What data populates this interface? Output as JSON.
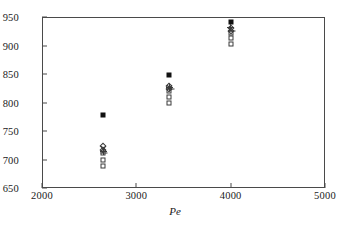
{
  "chart_data": {
    "type": "scatter",
    "title": "",
    "xlabel": "Pe",
    "ylabel": "",
    "xlim": [
      2000,
      5000
    ],
    "ylim": [
      650,
      950
    ],
    "xticks": [
      2000,
      3000,
      4000,
      5000
    ],
    "yticks": [
      650,
      700,
      750,
      800,
      850,
      900,
      950
    ],
    "grid": false,
    "legend": "none",
    "series": [
      {
        "name": "filled-square",
        "marker": "filled-square",
        "points": [
          {
            "x": 2650,
            "y": 778
          },
          {
            "x": 3350,
            "y": 848
          },
          {
            "x": 4000,
            "y": 942
          }
        ]
      },
      {
        "name": "open-square",
        "marker": "open-square",
        "points": [
          {
            "x": 2650,
            "y": 688
          },
          {
            "x": 2650,
            "y": 700
          },
          {
            "x": 2650,
            "y": 712
          },
          {
            "x": 3350,
            "y": 800
          },
          {
            "x": 3350,
            "y": 810
          },
          {
            "x": 3350,
            "y": 820
          },
          {
            "x": 4000,
            "y": 902
          },
          {
            "x": 4000,
            "y": 913
          },
          {
            "x": 4000,
            "y": 922
          }
        ]
      },
      {
        "name": "open-diamond",
        "marker": "open-diamond",
        "points": [
          {
            "x": 2650,
            "y": 723
          },
          {
            "x": 2650,
            "y": 716
          },
          {
            "x": 3350,
            "y": 829
          },
          {
            "x": 3350,
            "y": 823
          },
          {
            "x": 4000,
            "y": 930
          },
          {
            "x": 4000,
            "y": 925
          }
        ]
      },
      {
        "name": "cross",
        "marker": "cross",
        "points": [
          {
            "x": 2650,
            "y": 719
          },
          {
            "x": 3350,
            "y": 826
          },
          {
            "x": 4000,
            "y": 928
          }
        ]
      },
      {
        "name": "plus",
        "marker": "plus",
        "points": [
          {
            "x": 2650,
            "y": 714
          },
          {
            "x": 3350,
            "y": 827
          },
          {
            "x": 4000,
            "y": 932
          }
        ]
      },
      {
        "name": "dash",
        "marker": "dash",
        "points": [
          {
            "x": 2660,
            "y": 711
          },
          {
            "x": 3365,
            "y": 824
          },
          {
            "x": 4010,
            "y": 926
          }
        ]
      }
    ]
  }
}
